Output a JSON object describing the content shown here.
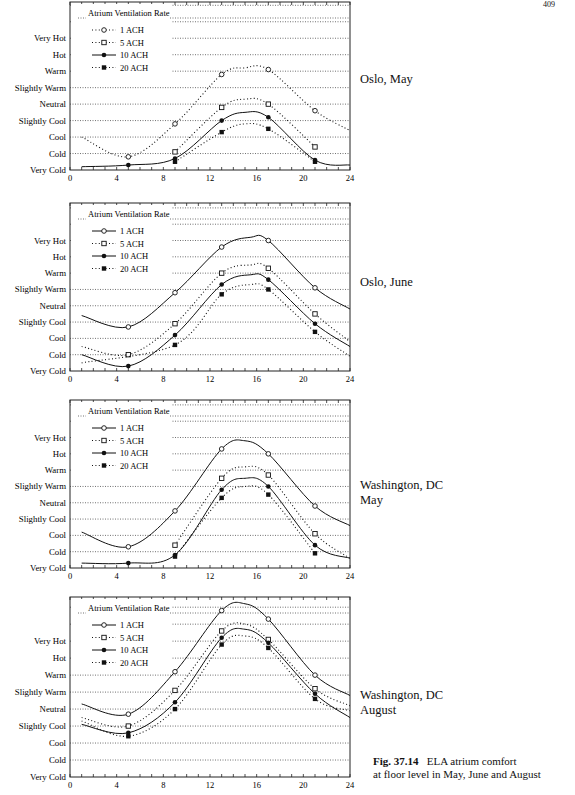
{
  "page_number": "409",
  "caption": {
    "fig_label": "Fig. 37.14",
    "line1": "ELA atrium comfort",
    "line2": "at floor level in May, June and August"
  },
  "chart_data": [
    {
      "type": "line",
      "title": "Oslo, May",
      "legend_title": "Atrium Ventilation Rate",
      "legend": [
        "1 ACH",
        "5 ACH",
        "10 ACH",
        "20 ACH"
      ],
      "xlabel": "",
      "ylabel": "",
      "xlim": [
        0,
        24
      ],
      "x_ticks": [
        "0",
        "4",
        "8",
        "12",
        "16",
        "20",
        "24"
      ],
      "y_levels": [
        "Very Cold",
        "Cold",
        "Cool",
        "Slightly Cool",
        "Neutral",
        "Slightly Warm",
        "Warm",
        "Hot",
        "Very Hot"
      ],
      "grid": "horizontal dotted",
      "x": [
        1,
        5,
        9,
        13,
        15,
        17,
        21,
        24
      ],
      "series": [
        {
          "name": "1 ACH",
          "style": "dotted",
          "marker": "open-circle",
          "values": [
            2.0,
            0.8,
            2.8,
            5.8,
            6.2,
            6.1,
            3.6,
            2.4
          ]
        },
        {
          "name": "5 ACH",
          "style": "dotted",
          "marker": "open-square",
          "values": [
            null,
            null,
            1.1,
            3.8,
            4.3,
            4.0,
            1.4,
            null
          ]
        },
        {
          "name": "10 ACH",
          "style": "solid",
          "marker": "filled-circle",
          "values": [
            0.2,
            0.3,
            0.7,
            3.0,
            3.5,
            3.2,
            0.6,
            0.3
          ]
        },
        {
          "name": "20 ACH",
          "style": "dotted",
          "marker": "filled-square",
          "values": [
            null,
            null,
            0.5,
            2.3,
            2.8,
            2.5,
            0.5,
            null
          ]
        }
      ],
      "markers_at": [
        5,
        9,
        13,
        17,
        21
      ]
    },
    {
      "type": "line",
      "title": "Oslo, June",
      "legend_title": "Atrium Ventilation Rate",
      "legend": [
        "1 ACH",
        "5 ACH",
        "10 ACH",
        "20 ACH"
      ],
      "xlim": [
        0,
        24
      ],
      "x_ticks": [
        "0",
        "4",
        "8",
        "12",
        "16",
        "20",
        "24"
      ],
      "y_levels": [
        "Very Cold",
        "Cold",
        "Cool",
        "Slightly Cool",
        "Neutral",
        "Slightly Warm",
        "Warm",
        "Hot",
        "Very Hot"
      ],
      "grid": "horizontal dotted",
      "x": [
        1,
        5,
        9,
        13,
        15.5,
        17,
        21,
        24
      ],
      "series": [
        {
          "name": "1 ACH",
          "style": "solid",
          "marker": "open-circle",
          "values": [
            3.4,
            2.7,
            4.8,
            7.6,
            8.2,
            8.0,
            5.1,
            3.8
          ]
        },
        {
          "name": "5 ACH",
          "style": "dotted",
          "marker": "open-square",
          "values": [
            1.5,
            1.0,
            2.9,
            6.0,
            6.5,
            6.3,
            3.5,
            1.8
          ]
        },
        {
          "name": "10 ACH",
          "style": "solid",
          "marker": "filled-circle",
          "values": [
            1.0,
            0.3,
            2.2,
            5.3,
            5.9,
            5.6,
            2.9,
            1.5
          ]
        },
        {
          "name": "20 ACH",
          "style": "dotted",
          "marker": "filled-square",
          "values": [
            0.5,
            null,
            1.6,
            4.7,
            5.3,
            5.0,
            2.4,
            0.9
          ]
        }
      ],
      "markers_at": [
        5,
        9,
        13,
        17,
        21
      ]
    },
    {
      "type": "line",
      "title": "Washington, DC May",
      "legend_title": "Atrium Ventilation Rate",
      "legend": [
        "1 ACH",
        "5 ACH",
        "10 ACH",
        "20 ACH"
      ],
      "xlim": [
        0,
        24
      ],
      "x_ticks": [
        "0",
        "4",
        "8",
        "12",
        "16",
        "20",
        "24"
      ],
      "y_levels": [
        "Very Cold",
        "Cold",
        "Cool",
        "Slightly Cool",
        "Neutral",
        "Slightly Warm",
        "Warm",
        "Hot",
        "Very Hot"
      ],
      "grid": "horizontal dotted",
      "x": [
        1,
        5,
        9,
        13,
        15,
        17,
        21,
        24
      ],
      "series": [
        {
          "name": "1 ACH",
          "style": "solid",
          "marker": "open-circle",
          "values": [
            2.2,
            1.3,
            3.5,
            7.3,
            7.8,
            7.0,
            3.8,
            2.6
          ]
        },
        {
          "name": "5 ACH",
          "style": "dotted",
          "marker": "open-square",
          "values": [
            null,
            null,
            1.4,
            5.5,
            6.2,
            5.7,
            2.1,
            0.6
          ]
        },
        {
          "name": "10 ACH",
          "style": "solid",
          "marker": "filled-circle",
          "values": [
            0.3,
            0.3,
            0.8,
            4.8,
            5.5,
            5.0,
            1.4,
            0.6
          ]
        },
        {
          "name": "20 ACH",
          "style": "dotted",
          "marker": "filled-square",
          "values": [
            null,
            null,
            0.7,
            4.3,
            5.0,
            4.5,
            0.9,
            null
          ]
        }
      ],
      "markers_at": [
        5,
        9,
        13,
        17,
        21
      ]
    },
    {
      "type": "line",
      "title": "Washington, DC August",
      "legend_title": "Atrium Ventilation Rate",
      "legend": [
        "1 ACH",
        "5 ACH",
        "10 ACH",
        "20 ACH"
      ],
      "xlim": [
        0,
        24
      ],
      "x_ticks": [
        "0",
        "4",
        "8",
        "12",
        "16",
        "20",
        "24"
      ],
      "y_levels": [
        "Very Cold",
        "Cold",
        "Cool",
        "Slightly Cool",
        "Neutral",
        "Slightly Warm",
        "Warm",
        "Hot",
        "Very Hot"
      ],
      "grid": "horizontal dotted",
      "x": [
        1,
        5,
        9,
        13,
        15,
        17,
        21,
        24
      ],
      "series": [
        {
          "name": "1 ACH",
          "style": "solid",
          "marker": "open-circle",
          "values": [
            4.3,
            3.7,
            6.2,
            9.8,
            10.2,
            9.3,
            6.0,
            4.8
          ]
        },
        {
          "name": "5 ACH",
          "style": "dotted",
          "marker": "open-square",
          "values": [
            3.5,
            3.0,
            5.1,
            8.6,
            9.0,
            8.1,
            5.2,
            4.2
          ]
        },
        {
          "name": "10 ACH",
          "style": "solid",
          "marker": "filled-circle",
          "values": [
            3.1,
            2.6,
            4.4,
            8.2,
            8.7,
            7.9,
            4.9,
            3.5
          ]
        },
        {
          "name": "20 ACH",
          "style": "dotted",
          "marker": "filled-square",
          "values": [
            3.3,
            2.4,
            4.0,
            7.8,
            8.3,
            7.6,
            4.6,
            3.9
          ]
        }
      ],
      "markers_at": [
        5,
        9,
        13,
        17,
        21
      ]
    }
  ],
  "panels": [
    {
      "place": "Oslo, May"
    },
    {
      "place": "Oslo, June"
    },
    {
      "place": "Washington, DC\nMay"
    },
    {
      "place": "Washington, DC\nAugust"
    }
  ]
}
